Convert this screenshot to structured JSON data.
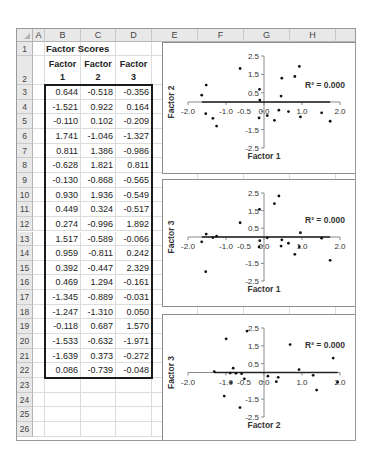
{
  "sheet": {
    "columns": [
      "A",
      "B",
      "C",
      "D",
      "E",
      "F",
      "G",
      "H",
      ""
    ],
    "rows": [
      "1",
      "2",
      "3",
      "4",
      "5",
      "6",
      "7",
      "8",
      "9",
      "10",
      "11",
      "12",
      "13",
      "14",
      "15",
      "16",
      "17",
      "18",
      "19",
      "20",
      "21",
      "22",
      "23",
      "24",
      "25",
      "26"
    ],
    "title": "Factor Scores",
    "headers": [
      {
        "line1": "Factor",
        "line2": "1"
      },
      {
        "line1": "Factor",
        "line2": "2"
      },
      {
        "line1": "Factor",
        "line2": "3"
      }
    ],
    "data": [
      [
        "0.644",
        "-0.518",
        "-0.356"
      ],
      [
        "-1.521",
        "0.922",
        "0.164"
      ],
      [
        "-0.110",
        "0.102",
        "-0.209"
      ],
      [
        "1.741",
        "-1.046",
        "-1.327"
      ],
      [
        "0.811",
        "1.386",
        "-0.986"
      ],
      [
        "-0.628",
        "1.821",
        "0.811"
      ],
      [
        "-0.130",
        "-0.868",
        "-0.565"
      ],
      [
        "0.930",
        "1.936",
        "-0.549"
      ],
      [
        "0.449",
        "0.324",
        "-0.517"
      ],
      [
        "0.274",
        "-0.996",
        "1.892"
      ],
      [
        "1.517",
        "-0.589",
        "-0.066"
      ],
      [
        "0.959",
        "-0.811",
        "0.242"
      ],
      [
        "0.392",
        "-0.447",
        "2.329"
      ],
      [
        "0.469",
        "1.294",
        "-0.161"
      ],
      [
        "-1.345",
        "-0.889",
        "-0.031"
      ],
      [
        "-1.247",
        "-1.310",
        "0.050"
      ],
      [
        "-0.118",
        "0.687",
        "1.570"
      ],
      [
        "-1.533",
        "-0.632",
        "-1.971"
      ],
      [
        "-1.639",
        "0.373",
        "-0.272"
      ],
      [
        "0.086",
        "-0.739",
        "-0.048"
      ]
    ]
  },
  "chart_data": [
    {
      "type": "scatter",
      "title": "",
      "xlabel": "Factor 1",
      "ylabel": "Factor 2",
      "xlim": [
        -2.0,
        2.0
      ],
      "ylim": [
        -2.5,
        2.5
      ],
      "xticks": [
        "-2.0",
        "-1.0",
        "0.0",
        "1.0",
        "2.0"
      ],
      "xticks_minor": [
        "-0.5"
      ],
      "yticks": [
        "2.5",
        "1.5",
        "0.5",
        "-0.5",
        "-1.5",
        "-2.5"
      ],
      "annotation": "R² = 0.000",
      "trendline": "linear",
      "x": [
        0.644,
        -1.521,
        -0.11,
        1.741,
        0.811,
        -0.628,
        -0.13,
        0.93,
        0.449,
        0.274,
        1.517,
        0.959,
        0.392,
        0.469,
        -1.345,
        -1.247,
        -0.118,
        -1.533,
        -1.639,
        0.086
      ],
      "y": [
        -0.518,
        0.922,
        0.102,
        -1.046,
        1.386,
        1.821,
        -0.868,
        1.936,
        0.324,
        -0.996,
        -0.589,
        -0.811,
        -0.447,
        1.294,
        -0.889,
        -1.31,
        0.687,
        -0.632,
        0.373,
        -0.739
      ]
    },
    {
      "type": "scatter",
      "title": "",
      "xlabel": "Factor 1",
      "ylabel": "Factor 3",
      "xlim": [
        -2.0,
        2.0
      ],
      "ylim": [
        -2.5,
        2.5
      ],
      "xticks": [
        "-2.0",
        "-1.0",
        "0.0",
        "1.0",
        "2.0"
      ],
      "xticks_minor": [
        "-0.5"
      ],
      "yticks": [
        "2.5",
        "1.5",
        "0.5",
        "-0.5",
        "-1.5",
        "-2.5"
      ],
      "annotation": "R² = 0.000",
      "trendline": "linear",
      "x": [
        0.644,
        -1.521,
        -0.11,
        1.741,
        0.811,
        -0.628,
        -0.13,
        0.93,
        0.449,
        0.274,
        1.517,
        0.959,
        0.392,
        0.469,
        -1.345,
        -1.247,
        -0.118,
        -1.533,
        -1.639,
        0.086
      ],
      "y": [
        -0.356,
        0.164,
        -0.209,
        -1.327,
        -0.986,
        0.811,
        -0.565,
        -0.549,
        -0.517,
        1.892,
        -0.066,
        0.242,
        2.329,
        -0.161,
        -0.031,
        0.05,
        1.57,
        -1.971,
        -0.272,
        -0.048
      ]
    },
    {
      "type": "scatter",
      "title": "",
      "xlabel": "Factor 2",
      "ylabel": "Factor 3",
      "xlim": [
        -2.0,
        2.0
      ],
      "ylim": [
        -2.5,
        2.5
      ],
      "xticks": [
        "-2.0",
        "-1.0",
        "0.0",
        "1.0",
        "2.0"
      ],
      "xticks_minor": [
        "-0.5"
      ],
      "yticks": [
        "2.5",
        "1.5",
        "0.5",
        "-0.5",
        "-1.5",
        "-2.5"
      ],
      "annotation": "R² = 0.000",
      "trendline": "linear",
      "x": [
        -0.518,
        0.922,
        0.102,
        -1.046,
        1.386,
        1.821,
        -0.868,
        1.936,
        0.324,
        -0.996,
        -0.589,
        -0.811,
        -0.447,
        1.294,
        -0.889,
        -1.31,
        0.687,
        -0.632,
        0.373,
        -0.739
      ],
      "y": [
        -0.356,
        0.164,
        -0.209,
        -1.327,
        -0.986,
        0.811,
        -0.565,
        -0.549,
        -0.517,
        1.892,
        -0.066,
        0.242,
        2.329,
        -0.161,
        -0.031,
        0.05,
        1.57,
        -1.971,
        -0.272,
        -0.048
      ]
    }
  ]
}
